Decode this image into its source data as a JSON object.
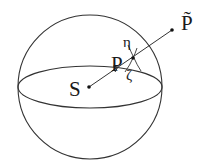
{
  "diagram": {
    "labels": {
      "source": "S",
      "point": "P",
      "eta": "η",
      "zeta": "ζ",
      "projected_point": "P̃"
    },
    "colors": {
      "stroke": "#333333",
      "background": "#ffffff"
    },
    "shapes": {
      "sphere": {
        "cx": 90,
        "cy": 87,
        "r": 72
      },
      "equator": {
        "cx": 90,
        "cy": 87,
        "rx": 72,
        "ry": 21
      },
      "ray": {
        "from": [
          89,
          87
        ],
        "to": [
          172,
          30
        ]
      },
      "point_S": [
        89,
        87
      ],
      "point_P_tilde": [
        172,
        30
      ],
      "intersection": [
        133,
        58
      ]
    }
  }
}
